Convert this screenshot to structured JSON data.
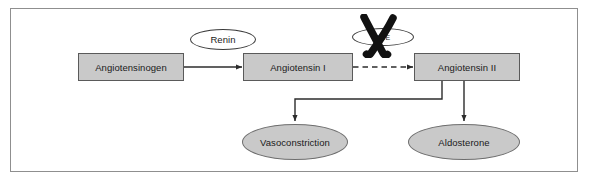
{
  "diagram": {
    "frame_border_color": "#8f8f8f",
    "background_color": "#ffffff",
    "node_fill_color": "#c9c9c9",
    "node_border_color": "#5a5a5a",
    "connector_color": "#3a3a3a"
  },
  "nodes": {
    "angiotensinogen": {
      "label": "Angiotensinogen",
      "shape": "box"
    },
    "angiotensin_i": {
      "label": "Angiotensin I",
      "shape": "box"
    },
    "angiotensin_ii": {
      "label": "Angiotensin II",
      "shape": "box"
    },
    "renin": {
      "label": "Renin",
      "shape": "ellipse"
    },
    "ace": {
      "label": "ACE",
      "shape": "ellipse"
    },
    "vasoconstriction": {
      "label": "Vasoconstriction",
      "shape": "ellipse"
    },
    "aldosterone": {
      "label": "Aldosterone",
      "shape": "ellipse"
    }
  },
  "edges": [
    {
      "from": "angiotensinogen",
      "to": "angiotensin_i",
      "style": "solid",
      "catalyst": "Renin"
    },
    {
      "from": "angiotensin_i",
      "to": "angiotensin_ii",
      "style": "dashed",
      "catalyst": "ACE",
      "blocked": true
    },
    {
      "from": "angiotensin_ii",
      "to": "vasoconstriction",
      "style": "solid"
    },
    {
      "from": "angiotensin_ii",
      "to": "aldosterone",
      "style": "solid"
    }
  ],
  "annotations": {
    "blockade_mark": "X",
    "blockade_target": "ACE"
  }
}
